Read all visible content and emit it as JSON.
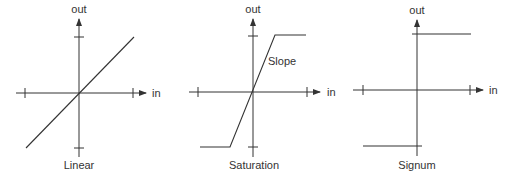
{
  "diagram": {
    "colors": {
      "line": "#333333",
      "background": "#ffffff"
    },
    "panels": [
      {
        "id": "linear",
        "caption": "Linear",
        "x_axis_label": "in",
        "y_axis_label": "out",
        "annotation": ""
      },
      {
        "id": "saturation",
        "caption": "Saturation",
        "x_axis_label": "in",
        "y_axis_label": "out",
        "annotation": "Slope"
      },
      {
        "id": "signum",
        "caption": "Signum",
        "x_axis_label": "in",
        "y_axis_label": "out",
        "annotation": ""
      }
    ]
  }
}
